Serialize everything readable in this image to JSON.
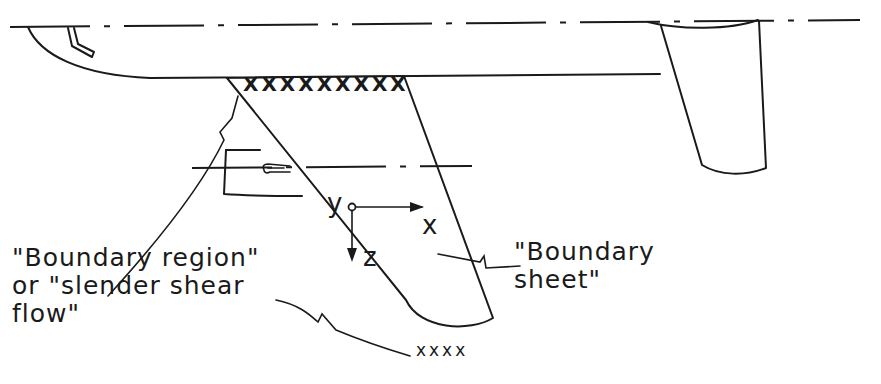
{
  "diagram": {
    "type": "aircraft-wing-flow-schematic",
    "labels": {
      "boundary_region": "\"Boundary region\"\nor \"slender shear\nflow\"",
      "boundary_sheet": "\"Boundary\nsheet\""
    },
    "axes": {
      "x": "x",
      "y": "y",
      "z": "z"
    },
    "root_marks": "XXXXXXXXX",
    "tip_marks": "xxxx",
    "colors": {
      "ink": "#1a1a1a",
      "background": "#ffffff"
    }
  }
}
